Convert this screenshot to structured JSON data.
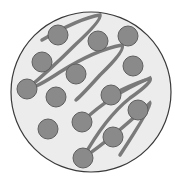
{
  "diagram": {
    "title": "",
    "colors": {
      "background": "#ffffff",
      "circle_fill": "#ececec",
      "circle_stroke": "#3a3a3a",
      "strand": "#7a7a7a",
      "dot_fill": "#8a8a8a",
      "dot_stroke": "#5f5f5f"
    },
    "circle": {
      "cx": 91,
      "cy": 92,
      "r": 80
    },
    "dots": [
      {
        "cx": 58,
        "cy": 35
      },
      {
        "cx": 98,
        "cy": 41
      },
      {
        "cx": 128,
        "cy": 36
      },
      {
        "cx": 42,
        "cy": 62
      },
      {
        "cx": 76,
        "cy": 74
      },
      {
        "cx": 133,
        "cy": 66
      },
      {
        "cx": 27,
        "cy": 89
      },
      {
        "cx": 56,
        "cy": 97
      },
      {
        "cx": 111,
        "cy": 95
      },
      {
        "cx": 138,
        "cy": 110
      },
      {
        "cx": 48,
        "cy": 129
      },
      {
        "cx": 82,
        "cy": 122
      },
      {
        "cx": 113,
        "cy": 137
      },
      {
        "cx": 83,
        "cy": 158
      }
    ],
    "dot_radius": 10
  }
}
